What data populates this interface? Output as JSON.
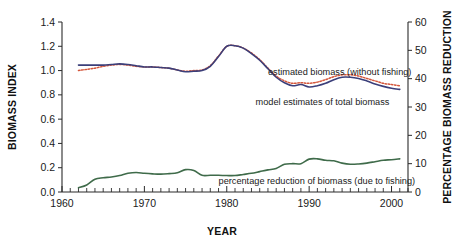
{
  "chart_data": {
    "type": "line",
    "title": "",
    "xlabel": "YEAR",
    "ylabel": "BIOMASS INDEX",
    "y2label": "PERCENTAGE BIOMASS REDUCTION",
    "xlim": [
      1960,
      2002
    ],
    "ylim": [
      0.0,
      1.4
    ],
    "y2lim": [
      0,
      60
    ],
    "grid": false,
    "legend_position": "inline-annotations",
    "xticks": [
      1960,
      1970,
      1980,
      1990,
      2000
    ],
    "xticklabels": [
      "1960",
      "1970",
      "1980",
      "1990",
      "2000"
    ],
    "x_minor_tick_interval": 1,
    "yticks": [
      0.0,
      0.2,
      0.4,
      0.6,
      0.8,
      1.0,
      1.2,
      1.4
    ],
    "yticklabels": [
      "0.0",
      "0.2",
      "0.4",
      "0.6",
      "0.8",
      "1.0",
      "1.2",
      "1.4"
    ],
    "y2ticks": [
      0,
      10,
      20,
      30,
      40,
      50,
      60
    ],
    "y2ticklabels": [
      "0",
      "10",
      "20",
      "30",
      "40",
      "50",
      "60"
    ],
    "x": [
      1962,
      1963,
      1964,
      1965,
      1966,
      1967,
      1968,
      1969,
      1970,
      1971,
      1972,
      1973,
      1974,
      1975,
      1976,
      1977,
      1978,
      1979,
      1980,
      1981,
      1982,
      1983,
      1984,
      1985,
      1986,
      1987,
      1988,
      1989,
      1990,
      1991,
      1992,
      1993,
      1994,
      1995,
      1996,
      1997,
      1998,
      1999,
      2000,
      2001
    ],
    "series": [
      {
        "name": "estimated biomass (without fishing)",
        "axis": "left",
        "style": "dotted",
        "color": "#d4573c",
        "values": [
          1.0,
          1.01,
          1.02,
          1.035,
          1.045,
          1.05,
          1.045,
          1.035,
          1.03,
          1.03,
          1.025,
          1.02,
          1.005,
          0.995,
          1.0,
          1.005,
          1.04,
          1.12,
          1.2,
          1.205,
          1.185,
          1.145,
          1.09,
          1.02,
          0.955,
          0.915,
          0.895,
          0.9,
          0.895,
          0.905,
          0.925,
          0.95,
          0.965,
          0.965,
          0.955,
          0.935,
          0.915,
          0.895,
          0.885,
          0.875
        ]
      },
      {
        "name": "model estimates of total biomass",
        "axis": "left",
        "style": "solid",
        "color": "#3b3f7a",
        "values": [
          1.045,
          1.045,
          1.045,
          1.045,
          1.05,
          1.055,
          1.05,
          1.04,
          1.03,
          1.03,
          1.025,
          1.02,
          1.005,
          0.99,
          0.995,
          1.0,
          1.035,
          1.115,
          1.2,
          1.205,
          1.185,
          1.14,
          1.085,
          1.015,
          0.945,
          0.9,
          0.875,
          0.885,
          0.865,
          0.875,
          0.895,
          0.925,
          0.945,
          0.945,
          0.935,
          0.915,
          0.89,
          0.87,
          0.855,
          0.845
        ]
      },
      {
        "name": "percentage reduction of biomass (due to fishing)",
        "axis": "right",
        "style": "solid",
        "color": "#3f6b4a",
        "values": [
          1.5,
          2.5,
          4.5,
          5.0,
          5.3,
          5.8,
          6.6,
          6.9,
          6.6,
          6.4,
          6.3,
          6.5,
          6.8,
          7.9,
          7.6,
          5.9,
          5.9,
          5.9,
          5.8,
          5.8,
          6.2,
          6.6,
          7.2,
          7.8,
          8.3,
          9.8,
          10.0,
          10.0,
          11.6,
          11.7,
          11.2,
          11.0,
          10.2,
          9.8,
          9.9,
          10.2,
          10.7,
          11.2,
          11.4,
          11.7
        ]
      }
    ],
    "annotations": [
      {
        "text": "estimated biomass (without fishing)",
        "x": 1985.0,
        "y": 0.96,
        "anchor": "start"
      },
      {
        "text": "model estimates of total biomass",
        "x": 1983.5,
        "y": 0.72,
        "anchor": "start"
      },
      {
        "text": "percentage reduction of biomass (due to fishing)",
        "x": 1979.0,
        "y": 0.07,
        "anchor": "start"
      }
    ]
  },
  "axes": {
    "left_title": "BIOMASS INDEX",
    "right_title": "PERCENTAGE BIOMASS REDUCTION",
    "bottom_title": "YEAR"
  },
  "colors": {
    "background": "#ffffff",
    "axis": "#2b2b2b",
    "series_dotted_red": "#d4573c",
    "series_solid_blue": "#3b3f7a",
    "series_solid_green": "#3f6b4a"
  }
}
